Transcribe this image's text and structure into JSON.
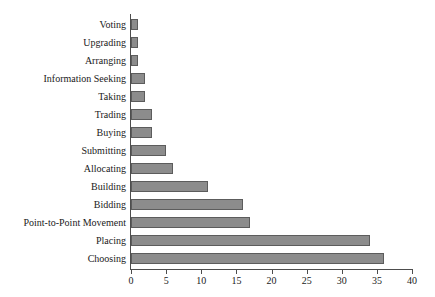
{
  "chart_data": {
    "type": "bar",
    "orientation": "horizontal",
    "title": "",
    "subtitle": "",
    "xlabel": "",
    "ylabel": "",
    "xlim": [
      0,
      40
    ],
    "xticks": [
      0,
      5,
      10,
      15,
      20,
      25,
      30,
      35,
      40
    ],
    "grid": false,
    "legend": null,
    "bar_color": "#8c8c8c",
    "bar_border_color": "#5c5c5c",
    "axis_color": "#4d4d4d",
    "text_color": "#1a1a1a",
    "background": "#ffffff",
    "categories": [
      "Voting",
      "Upgrading",
      "Arranging",
      "Information Seeking",
      "Taking",
      "Trading",
      "Buying",
      "Submitting",
      "Allocating",
      "Building",
      "Bidding",
      "Point-to-Point Movement",
      "Placing",
      "Choosing"
    ],
    "values": [
      1,
      1,
      1,
      2,
      2,
      3,
      3,
      5,
      6,
      11,
      16,
      17,
      34,
      36
    ]
  }
}
